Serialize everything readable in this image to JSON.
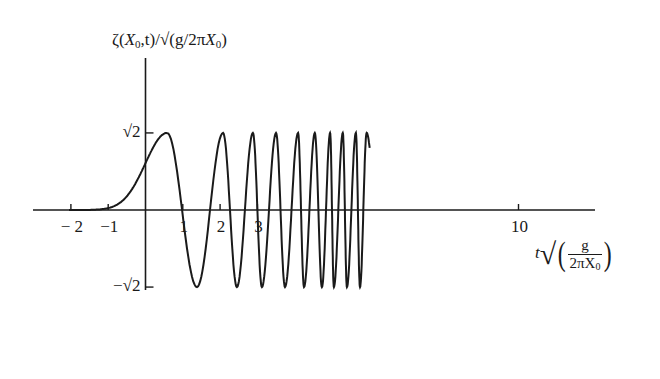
{
  "chart_data": {
    "type": "line",
    "title": "",
    "ylabel": "ζ(X₀,t)/√(g/2πX₀)",
    "ylabel_parts": {
      "zeta": "ζ",
      "open": "(",
      "X": "X",
      "sub0": "0",
      "rest": ",t)/√(g/2π",
      "X2": "X",
      "sub02": "0",
      "close": ")"
    },
    "xlabel": "t√(g/(2πX₀))",
    "xlabel_parts": {
      "t": "t",
      "sqrt": "√",
      "num": "g",
      "den": "2πX",
      "den_sub": "0"
    },
    "x_ticks": [
      {
        "value": -2,
        "label": "− 2"
      },
      {
        "value": -1,
        "label": "−1"
      },
      {
        "value": 1,
        "label": "1"
      },
      {
        "value": 2,
        "label": "2"
      },
      {
        "value": 3,
        "label": "3"
      },
      {
        "value": 10,
        "label": "10"
      }
    ],
    "y_ticks": [
      {
        "value": 1.41421,
        "label": "√2"
      },
      {
        "value": -1.41421,
        "label": "−√2"
      }
    ],
    "xlim": [
      -3,
      12.0
    ],
    "ylim": [
      -1.6,
      2.8
    ],
    "grid": false,
    "legend": "none",
    "series": [
      {
        "name": "surface elevation",
        "rise": {
          "t_start": -1.9,
          "t_peak": 0.58,
          "value_at_0": 0.86
        },
        "extrema": [
          {
            "t": 0.58,
            "v": 1.414
          },
          {
            "t": 1.38,
            "v": -1.414
          },
          {
            "t": 2.08,
            "v": 1.414
          },
          {
            "t": 2.45,
            "v": -1.414
          },
          {
            "t": 2.88,
            "v": 1.414
          },
          {
            "t": 3.12,
            "v": -1.414
          },
          {
            "t": 3.5,
            "v": 1.414
          },
          {
            "t": 3.74,
            "v": -1.414
          },
          {
            "t": 4.09,
            "v": 1.414
          },
          {
            "t": 4.25,
            "v": -1.414
          },
          {
            "t": 4.54,
            "v": 1.414
          },
          {
            "t": 4.73,
            "v": -1.414
          },
          {
            "t": 4.95,
            "v": 1.414
          },
          {
            "t": 5.05,
            "v": -1.414
          },
          {
            "t": 5.29,
            "v": 1.414
          },
          {
            "t": 5.4,
            "v": -1.414
          },
          {
            "t": 5.64,
            "v": 1.414
          },
          {
            "t": 5.75,
            "v": -1.414
          },
          {
            "t": 5.93,
            "v": 1.414
          }
        ],
        "end": {
          "t": 6.01,
          "v": 1.14
        }
      }
    ]
  },
  "layout": {
    "origin_px": [
      145.5,
      210
    ],
    "px_per_x": 37.3,
    "px_per_y": 54.5,
    "x_axis_px": [
      33,
      595
    ],
    "y_axis_px": [
      58,
      290
    ],
    "line_color": "#1a1a1a"
  }
}
